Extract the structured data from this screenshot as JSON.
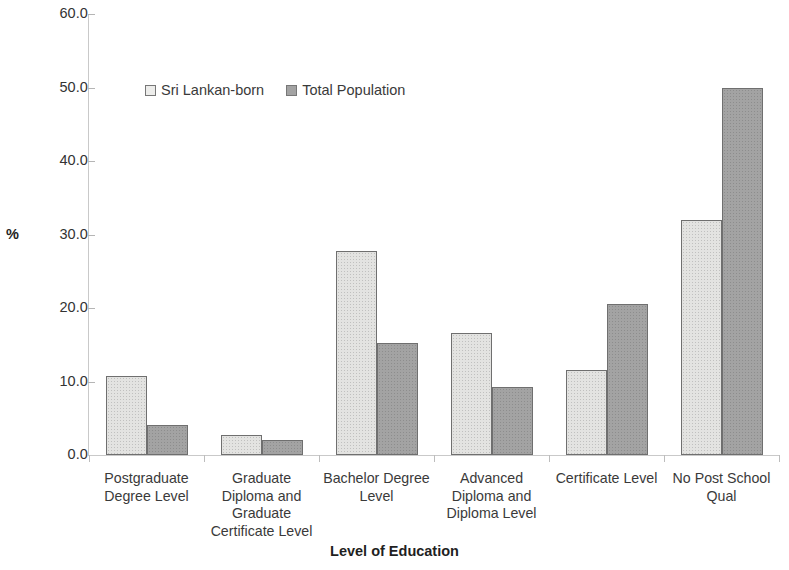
{
  "chart_data": {
    "type": "bar",
    "title": "",
    "xlabel": "Level of Education",
    "ylabel": "%",
    "ylim": [
      0.0,
      60.0
    ],
    "ytick_step": 10.0,
    "yticks": [
      "60.0",
      "50.0",
      "40.0",
      "30.0",
      "20.0",
      "10.0",
      "0.0"
    ],
    "ytick_values": [
      60.0,
      50.0,
      40.0,
      30.0,
      20.0,
      10.0,
      0.0
    ],
    "grid": false,
    "legend_position": "upper-left-inside",
    "categories": [
      "Postgraduate Degree Level",
      "Graduate Diploma and Graduate Certificate Level",
      "Bachelor Degree Level",
      "Advanced Diploma and Diploma Level",
      "Certificate Level",
      "No Post School Qual"
    ],
    "category_lines": [
      [
        "Postgraduate",
        "Degree Level"
      ],
      [
        "Graduate",
        "Diploma and",
        "Graduate",
        "Certificate Level"
      ],
      [
        "Bachelor Degree",
        "Level"
      ],
      [
        "Advanced",
        "Diploma and",
        "Diploma Level"
      ],
      [
        "Certificate Level"
      ],
      [
        "No Post School",
        "Qual"
      ]
    ],
    "series": [
      {
        "name": "Sri Lankan-born",
        "color": "#e3e3e1",
        "values": [
          10.8,
          2.7,
          27.7,
          16.6,
          11.6,
          32.0
        ]
      },
      {
        "name": "Total Population",
        "color": "#a3a3a3",
        "values": [
          4.1,
          2.0,
          15.2,
          9.3,
          20.6,
          50.0
        ]
      }
    ]
  },
  "legend": {
    "entries": [
      {
        "label": "Sri Lankan-born",
        "swatch": "light-swatch-icon"
      },
      {
        "label": "Total Population",
        "swatch": "dark-swatch-icon"
      }
    ]
  }
}
